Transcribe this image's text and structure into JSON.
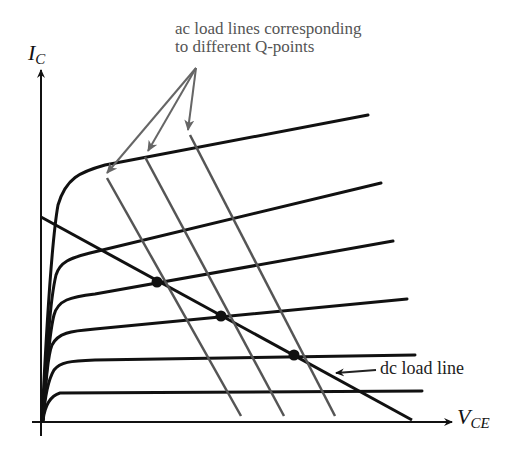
{
  "diagram": {
    "annotations": {
      "ac_label_line1": "ac load lines corresponding",
      "ac_label_line2": "to different Q-points",
      "dc_label": "dc load line"
    },
    "axes": {
      "y_label_main": "I",
      "y_label_sub": "C",
      "x_label_main": "V",
      "x_label_sub": "CE"
    },
    "colors": {
      "curves": "#111111",
      "ac_lines": "#555555",
      "annotation_arrows": "#666666",
      "background": "#ffffff"
    },
    "characteristic_curves_count": 6,
    "ac_load_lines_count": 3,
    "q_points_count": 3
  }
}
